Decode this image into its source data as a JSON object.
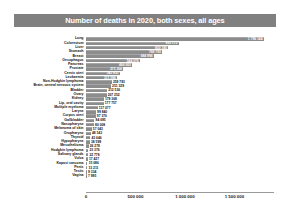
{
  "chart_data": {
    "type": "bar",
    "orientation": "horizontal",
    "title": "Number of deaths in 2020, both sexes, all ages",
    "xlabel": "",
    "ylabel": "",
    "xlim": [
      0,
      1900000
    ],
    "grid": false,
    "legend": false,
    "tick_labels": [
      "0",
      "500 000",
      "1 000 000",
      "1 500 000"
    ],
    "tick_values": [
      0,
      500000,
      1000000,
      1500000
    ],
    "categories": [
      "Lung",
      "Colorectum",
      "Liver",
      "Stomach",
      "Breast",
      "Oesophagus",
      "Pancreas",
      "Prostate",
      "Cervix uteri",
      "Leukaemia",
      "Non-Hodgkin lymphoma",
      "Brain, central nervous system",
      "Bladder",
      "Ovary",
      "Kidney",
      "Lip, oral cavity",
      "Multiple myeloma",
      "Larynx",
      "Corpus uteri",
      "Gallbladder",
      "Nasopharynx",
      "Melanoma of skin",
      "Oropharynx",
      "Thyroid",
      "Hypopharynx",
      "Mesothelioma",
      "Hodgkin lymphoma",
      "Salivary glands",
      "Vulva",
      "Kaposi sarcoma",
      "Penis",
      "Testis",
      "Vagina"
    ],
    "values": [
      1796144,
      935173,
      830180,
      768793,
      684996,
      544076,
      466003,
      375304,
      341831,
      311594,
      259793,
      251329,
      212536,
      207252,
      179368,
      177757,
      117077,
      99840,
      97370,
      84695,
      80008,
      57043,
      48143,
      43646,
      38599,
      26278,
      23376,
      22778,
      17427,
      15086,
      13211,
      9334,
      7995
    ],
    "value_labels": [
      "1 796 144",
      "935 173",
      "830 180",
      "768 793",
      "684 996",
      "544 076",
      "466 003",
      "375 304",
      "341 831",
      "311 594",
      "259 793",
      "251 329",
      "212 536",
      "207 252",
      "179 368",
      "177 757",
      "117 077",
      "99 840",
      "97 370",
      "84 695",
      "80 008",
      "57 043",
      "48 143",
      "43 646",
      "38 599",
      "26 278",
      "23 376",
      "22 778",
      "17 427",
      "15 086",
      "13 211",
      "9 334",
      "7 995"
    ],
    "colors": {
      "bar": "#8c8c8c",
      "bar_highlight": "#a6a6a6",
      "title_background": "#808080",
      "title_text": "#ffffff",
      "axis": "#9a9a9a",
      "text": "#111111",
      "background": "#ffffff"
    }
  }
}
